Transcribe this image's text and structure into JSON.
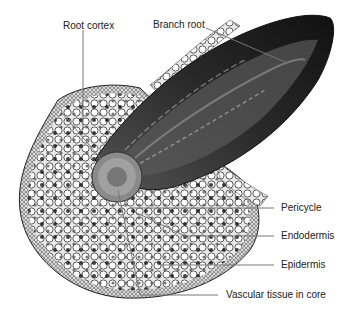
{
  "figure": {
    "labels": {
      "root_cortex": "Root cortex",
      "branch_root": "Branch root",
      "pericycle": "Pericycle",
      "endodermis": "Endodermis",
      "epidermis": "Epidermis",
      "vascular_tissue": "Vascular tissue in core"
    }
  }
}
